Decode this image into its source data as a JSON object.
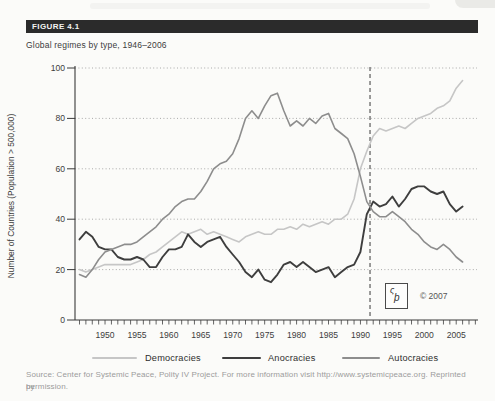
{
  "figure": {
    "label": "FIGURE 4.1",
    "title": "Global regimes by type, 1946–2006"
  },
  "source_note": {
    "line1": "Source: Center for Systemic Peace, Polity IV Project. For more information visit http://www.systemicpeace.org. Reprinted by",
    "line2": "permission."
  },
  "copyright": "© 2007",
  "logo": {
    "name": "csp-logo",
    "glyph_top": "ς",
    "glyph_bottom": "þ"
  },
  "chart_data": {
    "type": "line",
    "title": "Global regimes by type, 1946–2006",
    "xlabel": "",
    "ylabel": "Number of Countries (Population > 500,000)",
    "x_start": 1946,
    "x_end": 2006,
    "x_step": 1,
    "xlim": [
      1946,
      2008
    ],
    "ylim": [
      0,
      100
    ],
    "yticks": [
      0,
      20,
      40,
      60,
      80,
      100
    ],
    "xticks_labeled": [
      1950,
      1955,
      1960,
      1965,
      1970,
      1975,
      1980,
      1985,
      1990,
      1995,
      2000,
      2005
    ],
    "grid": "horizontal-dotted",
    "legend_position": "bottom",
    "annotation_vline": {
      "year": 1991.5,
      "style": "dashed"
    },
    "series": [
      {
        "name": "Democracies",
        "color": "#c6c6c6",
        "width": 1.6,
        "values": [
          20,
          19,
          20,
          21,
          22,
          22,
          22,
          22,
          22,
          23,
          24,
          26,
          27,
          29,
          31,
          33,
          35,
          34,
          35,
          36,
          34,
          35,
          34,
          33,
          32,
          31,
          33,
          34,
          35,
          34,
          34,
          36,
          36,
          37,
          36,
          38,
          37,
          38,
          39,
          38,
          40,
          40,
          42,
          48,
          60,
          67,
          73,
          76,
          75,
          76,
          77,
          76,
          78,
          80,
          81,
          82,
          84,
          85,
          87,
          92,
          95
        ]
      },
      {
        "name": "Anocracies",
        "color": "#3e3e3e",
        "width": 1.9,
        "values": [
          32,
          35,
          33,
          29,
          28,
          28,
          25,
          24,
          24,
          25,
          24,
          21,
          21,
          25,
          28,
          28,
          29,
          34,
          31,
          29,
          31,
          32,
          33,
          29,
          26,
          23,
          19,
          17,
          20,
          16,
          15,
          18,
          22,
          23,
          21,
          23,
          21,
          19,
          20,
          21,
          17,
          19,
          21,
          22,
          27,
          42,
          47,
          45,
          46,
          49,
          45,
          48,
          52,
          53,
          53,
          51,
          50,
          51,
          46,
          43,
          45
        ]
      },
      {
        "name": "Autocracies",
        "color": "#8d8d8d",
        "width": 1.6,
        "values": [
          18,
          17,
          20,
          24,
          27,
          28,
          29,
          30,
          30,
          31,
          33,
          35,
          37,
          40,
          42,
          45,
          47,
          48,
          48,
          51,
          55,
          60,
          62,
          63,
          66,
          72,
          80,
          83,
          80,
          85,
          89,
          90,
          83,
          77,
          79,
          77,
          80,
          78,
          81,
          82,
          76,
          74,
          72,
          66,
          57,
          47,
          43,
          41,
          41,
          43,
          41,
          39,
          36,
          34,
          31,
          29,
          28,
          30,
          28,
          25,
          23
        ]
      }
    ]
  }
}
